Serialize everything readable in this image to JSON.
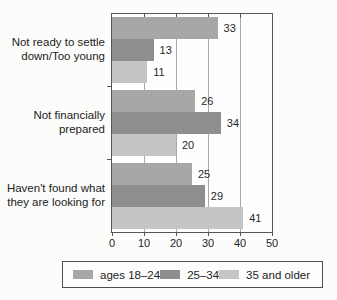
{
  "chart_data": {
    "type": "bar",
    "orientation": "horizontal",
    "title": "",
    "xlabel": "",
    "ylabel": "",
    "categories": [
      "Not ready to settle down/Too young",
      "Not financially prepared",
      "Haven't found what they are looking for"
    ],
    "category_label_lines": [
      [
        "Not ready to settle",
        "down/Too young"
      ],
      [
        "Not financially",
        "prepared"
      ],
      [
        "Haven't found what",
        "they are looking for"
      ]
    ],
    "series": [
      {
        "name": "ages 18–24",
        "color": "#a7a7a7",
        "values": [
          33,
          26,
          25
        ]
      },
      {
        "name": "25–34",
        "color": "#8e8e8e",
        "values": [
          13,
          34,
          29
        ]
      },
      {
        "name": "35 and older",
        "color": "#c5c5c5",
        "values": [
          11,
          20,
          41
        ]
      }
    ],
    "value_labels_shown": true,
    "xlim": [
      0,
      50
    ],
    "x_ticks": [
      0,
      10,
      20,
      30,
      40,
      50
    ],
    "grid": true,
    "legend_position": "bottom"
  },
  "colors": {
    "frame": "#565656",
    "gridline": "#a9a9a9",
    "text": "#232323",
    "background": "#fcfcfb"
  }
}
